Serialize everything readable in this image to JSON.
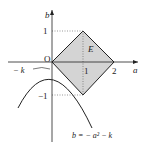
{
  "labels": {
    "a_axis": "a",
    "b_axis": "b",
    "origin": "O",
    "region": "E",
    "x_one": "1",
    "x_two": "2",
    "y_one": "1",
    "y_neg_one": "−1",
    "neg_k": "− k",
    "curve": "b = − a² − k"
  },
  "colors": {
    "region_fill": "#d4d4d4",
    "stroke": "#222222"
  }
}
